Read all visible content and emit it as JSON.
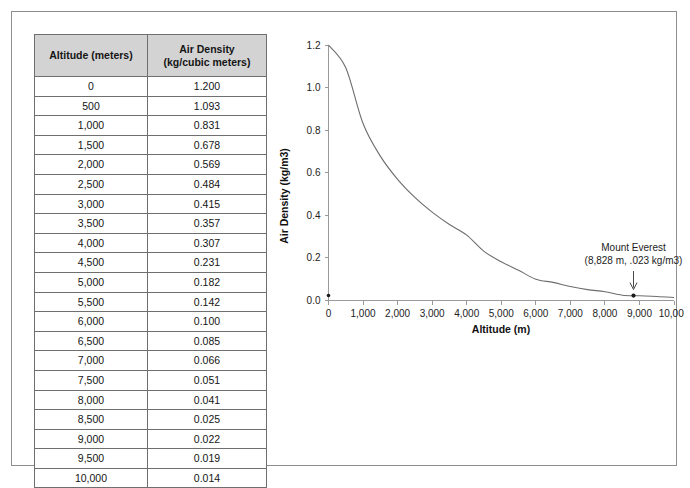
{
  "table": {
    "headers": [
      "Altitude (meters)",
      "Air Density\n(kg/cubic meters)"
    ],
    "header_altitude": "Altitude (meters)",
    "header_density_line1": "Air Density",
    "header_density_line2": "(kg/cubic meters)",
    "rows": [
      {
        "altitude": "0",
        "density": "1.200"
      },
      {
        "altitude": "500",
        "density": "1.093"
      },
      {
        "altitude": "1,000",
        "density": "0.831"
      },
      {
        "altitude": "1,500",
        "density": "0.678"
      },
      {
        "altitude": "2,000",
        "density": "0.569"
      },
      {
        "altitude": "2,500",
        "density": "0.484"
      },
      {
        "altitude": "3,000",
        "density": "0.415"
      },
      {
        "altitude": "3,500",
        "density": "0.357"
      },
      {
        "altitude": "4,000",
        "density": "0.307"
      },
      {
        "altitude": "4,500",
        "density": "0.231"
      },
      {
        "altitude": "5,000",
        "density": "0.182"
      },
      {
        "altitude": "5,500",
        "density": "0.142"
      },
      {
        "altitude": "6,000",
        "density": "0.100"
      },
      {
        "altitude": "6,500",
        "density": "0.085"
      },
      {
        "altitude": "7,000",
        "density": "0.066"
      },
      {
        "altitude": "7,500",
        "density": "0.051"
      },
      {
        "altitude": "8,000",
        "density": "0.041"
      },
      {
        "altitude": "8,500",
        "density": "0.025"
      },
      {
        "altitude": "9,000",
        "density": "0.022"
      },
      {
        "altitude": "9,500",
        "density": "0.019"
      },
      {
        "altitude": "10,000",
        "density": "0.014"
      }
    ]
  },
  "chart_data": {
    "type": "line",
    "title": "",
    "xlabel": "Altitude (m)",
    "ylabel": "Air Density (kg/m3)",
    "xlim": [
      0,
      10000
    ],
    "ylim": [
      0.0,
      1.2
    ],
    "grid": false,
    "legend": null,
    "xticks": [
      0,
      1000,
      2000,
      3000,
      4000,
      5000,
      6000,
      7000,
      8000,
      9000,
      10000
    ],
    "xtick_labels": [
      "0",
      "1,000",
      "2,000",
      "3,000",
      "4,000",
      "5,000",
      "6,000",
      "7,000",
      "8,000",
      "9,000",
      "10,000"
    ],
    "yticks": [
      0.0,
      0.2,
      0.4,
      0.6,
      0.8,
      1.0,
      1.2
    ],
    "ytick_labels": [
      "0.0",
      "0.2",
      "0.4",
      "0.6",
      "0.8",
      "1.0",
      "1.2"
    ],
    "x": [
      0,
      500,
      1000,
      1500,
      2000,
      2500,
      3000,
      3500,
      4000,
      4500,
      5000,
      5500,
      6000,
      6500,
      7000,
      7500,
      8000,
      8500,
      9000,
      9500,
      10000
    ],
    "y": [
      1.2,
      1.093,
      0.831,
      0.678,
      0.569,
      0.484,
      0.415,
      0.357,
      0.307,
      0.231,
      0.182,
      0.142,
      0.1,
      0.085,
      0.066,
      0.051,
      0.041,
      0.025,
      0.022,
      0.019,
      0.014
    ],
    "series": [
      {
        "name": "Air Density",
        "x": [
          0,
          500,
          1000,
          1500,
          2000,
          2500,
          3000,
          3500,
          4000,
          4500,
          5000,
          5500,
          6000,
          6500,
          7000,
          7500,
          8000,
          8500,
          9000,
          9500,
          10000
        ],
        "values": [
          1.2,
          1.093,
          0.831,
          0.678,
          0.569,
          0.484,
          0.415,
          0.357,
          0.307,
          0.231,
          0.182,
          0.142,
          0.1,
          0.085,
          0.066,
          0.051,
          0.041,
          0.025,
          0.022,
          0.019,
          0.014
        ],
        "color": "#6d6d6d"
      }
    ],
    "annotations": [
      {
        "name": "mount-everest",
        "line1": "Mount Everest",
        "line2": "(8,828 m, .023 kg/m3)",
        "x": 8828,
        "y": 0.023,
        "marker": "dot-with-arrow"
      }
    ]
  },
  "colors": {
    "header_fill": "#d3d3d3",
    "table_border": "#6f6f6f",
    "frame_border": "#8e8e8e",
    "curve": "#6d6d6d",
    "axis": "#9a9a9a"
  }
}
